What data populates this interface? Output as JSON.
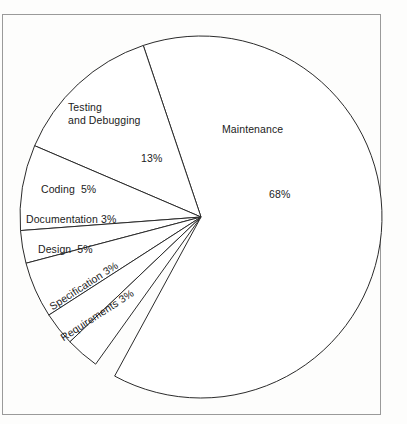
{
  "figure": {
    "background_color": "#fdfdfc",
    "line_color": "#2b2b2b",
    "rule_color": "#9a9a9a"
  },
  "chart_data": {
    "type": "pie",
    "title": "",
    "subtitle": "",
    "xlabel": "",
    "ylabel": "",
    "legend_position": "none",
    "grid": false,
    "labels_inside_slices": true,
    "total_percent": 100,
    "categories": [
      "Maintenance",
      "Testing and Debugging",
      "Coding",
      "Documentation",
      "Design",
      "Specification",
      "Requirements"
    ],
    "values": [
      68,
      13,
      5,
      3,
      5,
      3,
      3
    ],
    "slices": [
      {
        "name": "Maintenance",
        "label": "Maintenance",
        "percent_label": "68%",
        "value": 68,
        "start_angle_deg": -108.6,
        "end_angle_deg": 118.5,
        "label_x": 222,
        "label_y": 123,
        "percent_x": 269,
        "percent_y": 188,
        "rotation_deg": 0
      },
      {
        "name": "Testing and Debugging",
        "label_line_1": "Testing",
        "label_line_2": "and Debugging",
        "percent_label": "13%",
        "value": 13,
        "start_angle_deg": -156.8,
        "end_angle_deg": -108.6,
        "label_x": 68,
        "label_y": 101,
        "percent_x": 141,
        "percent_y": 152,
        "rotation_deg": 0
      },
      {
        "name": "Coding",
        "label": "Coding  5%",
        "percent_label": "5%",
        "value": 5,
        "start_angle_deg": -184.3,
        "end_angle_deg": -156.8,
        "label_x": 41,
        "label_y": 183,
        "rotation_deg": 0
      },
      {
        "name": "Documentation",
        "label": "Documentation 3%",
        "percent_label": "3%",
        "value": 3,
        "start_angle_deg": -194.8,
        "end_angle_deg": -184.3,
        "label_x": 26,
        "label_y": 213,
        "rotation_deg": 0
      },
      {
        "name": "Design",
        "label": "Design  5%",
        "percent_label": "5%",
        "value": 5,
        "start_angle_deg": -212.8,
        "end_angle_deg": -194.8,
        "label_x": 38,
        "label_y": 243,
        "rotation_deg": 0
      },
      {
        "name": "Specification",
        "label": "Specification 3%",
        "percent_label": "3%",
        "value": 3,
        "start_angle_deg": -223.6,
        "end_angle_deg": -212.8,
        "label_x": 47,
        "label_y": 302,
        "rotation_deg": -33
      },
      {
        "name": "Requirements",
        "label": "Requirements 3%",
        "percent_label": "3%",
        "value": 3,
        "start_angle_deg": -234.4,
        "end_angle_deg": -223.6,
        "label_x": 58,
        "label_y": 333,
        "rotation_deg": -33
      }
    ],
    "geometry": {
      "center_x": 201,
      "center_y": 217,
      "radius": 181
    }
  }
}
